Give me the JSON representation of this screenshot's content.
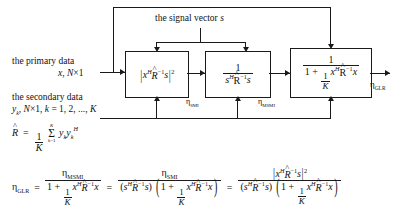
{
  "diagram": {
    "title_label": "the signal vector s",
    "inputs": {
      "primary_line1": "the primary data",
      "primary_line2": "x, N×1",
      "secondary_line1": "the secondary data",
      "secondary_line2": "y_k, N×1, k = 1, 2, ..., K"
    },
    "blocks": [
      {
        "id": "block-smi",
        "expression": "|x^H R̂^{-1} s|^2",
        "output_label": "η_SMI"
      },
      {
        "id": "block-msmi",
        "expression": "1 / (s^H R̂^{-1} s)",
        "output_label": "η_MSMI"
      },
      {
        "id": "block-glr",
        "expression": "1 / (1 + (1/K) x^H R̂^{-1} x)",
        "output_label": "η_GLR"
      }
    ],
    "covariance": {
      "symbol": "R̂",
      "definition": "R̂ = (1/K) Σ_{k=1}^{K} y_k y_k^H"
    },
    "equation": {
      "lhs": "η_GLR",
      "expr1": "η_MSMI / (1 + (1/K) x^H R̂^{-1} x)",
      "expr2": "η_SMI / ((s^H R̂^{-1} s)(1 + (1/K) x^H R̂^{-1} x))",
      "expr3": "|x^H R̂^{-1} s|^2 / ((s^H R̂^{-1} s)(1 + (1/K) x^H R̂^{-1} x))",
      "eq_sign": "=",
      "plus_sign": "+"
    },
    "symbols": {
      "eta": "η",
      "x": "x",
      "s": "s",
      "K": "K",
      "H": "H",
      "one": "1",
      "minus_one": "-1",
      "two": "2",
      "sub_smi": "SMI",
      "sub_msmi": "MSMI",
      "sub_glr": "GLR",
      "sigma": "Σ",
      "sum_upper": "K",
      "sum_lower": "k = 1",
      "y": "y",
      "k": "k"
    },
    "colors": {
      "line": "#1a1a1a",
      "background": "#ffffff",
      "text": "#111111"
    }
  }
}
